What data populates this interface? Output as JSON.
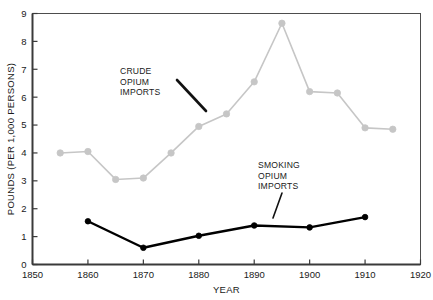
{
  "chart_data": {
    "type": "line",
    "title": "",
    "xlabel": "YEAR",
    "ylabel": "POUNDS (PER 1,000 PERSONS)",
    "xlim": [
      1850,
      1920
    ],
    "ylim": [
      0,
      9
    ],
    "xticks": [
      1850,
      1860,
      1870,
      1880,
      1890,
      1900,
      1910,
      1920
    ],
    "xticklabels": [
      "1850",
      "1860",
      "1870",
      "1880",
      "1890",
      "1900",
      "1910",
      "1920"
    ],
    "yticks": [
      0,
      1,
      2,
      3,
      4,
      5,
      6,
      7,
      8,
      9
    ],
    "yticklabels": [
      "0",
      "1",
      "2",
      "3",
      "4",
      "5",
      "6",
      "7",
      "8",
      "9"
    ],
    "grid": false,
    "legend_position": "none",
    "series": [
      {
        "name": "CRUDE OPIUM IMPORTS",
        "color": "#c6c6c6",
        "marker": "circle",
        "x": [
          1855,
          1860,
          1865,
          1870,
          1875,
          1880,
          1885,
          1890,
          1895,
          1900,
          1905,
          1910,
          1915
        ],
        "values": [
          4.0,
          4.05,
          3.05,
          3.1,
          4.0,
          4.95,
          5.4,
          6.55,
          8.65,
          6.2,
          6.15,
          4.9,
          4.85
        ]
      },
      {
        "name": "SMOKING OPIUM IMPORTS",
        "color": "#000000",
        "marker": "circle",
        "x": [
          1860,
          1870,
          1880,
          1890,
          1900,
          1910
        ],
        "values": [
          1.55,
          0.6,
          1.03,
          1.4,
          1.33,
          1.7
        ]
      }
    ],
    "annotations": [
      {
        "name": "crude-opium-annotation",
        "lines": [
          "CRUDE",
          "OPIUM",
          "IMPORTS"
        ],
        "text_x": 120,
        "text_y": 74,
        "leader": {
          "x1": 177,
          "y1": 80,
          "x2": 206,
          "y2": 111
        }
      },
      {
        "name": "smoking-opium-annotation",
        "lines": [
          "SMOKING",
          "OPIUM",
          "IMPORTS"
        ],
        "text_x": 258,
        "text_y": 168,
        "leader": {
          "x1": 282,
          "y1": 193,
          "x2": 273,
          "y2": 218
        }
      }
    ]
  }
}
